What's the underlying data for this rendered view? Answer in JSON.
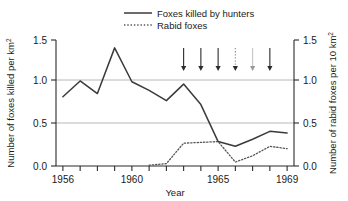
{
  "chart_data": {
    "type": "line",
    "title": "",
    "xlabel": "Year",
    "ylabel": "Number of foxes killed per km2",
    "ylabel_right": "Number of rabid foxes per 10 km2",
    "x": [
      1956,
      1957,
      1958,
      1959,
      1960,
      1961,
      1962,
      1963,
      1964,
      1965,
      1966,
      1967,
      1968,
      1969
    ],
    "xlim": [
      1955.6,
      1969.4
    ],
    "ylim": [
      0.0,
      1.6
    ],
    "ylim_right": [
      0.0,
      1.6
    ],
    "yticks": [
      "0.0",
      "0.5",
      "1.0",
      "1.5"
    ],
    "ytick_values": [
      0.0,
      0.5,
      1.0,
      1.5
    ],
    "yticks_right": [
      "0.0",
      "0.5",
      "1.0",
      "1.5"
    ],
    "xticks_labeled": [
      "1956",
      "1960",
      "1965",
      "1969"
    ],
    "xtick_values_labeled": [
      1956,
      1960,
      1965,
      1969
    ],
    "xtick_values_minor": [
      1957,
      1958,
      1959,
      1961,
      1962,
      1963,
      1964,
      1966,
      1967,
      1968
    ],
    "grid": "horizontal gridlines at 0.5 and 1.0",
    "legend_position": "top-center",
    "series": [
      {
        "name": "Foxes killed by hunters",
        "style": "solid",
        "color": "#3a3a3a",
        "axis": "left",
        "values": [
          0.88,
          1.08,
          0.92,
          1.5,
          1.07,
          0.96,
          0.83,
          1.04,
          0.78,
          0.31,
          0.25,
          0.34,
          0.44,
          0.42
        ]
      },
      {
        "name": "Rabid foxes",
        "style": "dotted",
        "color": "#555555",
        "axis": "right",
        "values": [
          null,
          null,
          null,
          null,
          null,
          0.01,
          0.03,
          0.29,
          0.3,
          0.31,
          0.05,
          0.13,
          0.25,
          0.22
        ]
      }
    ],
    "annotations": {
      "name": "downward-arrows",
      "description": "Six downward arrows above the plot indicating events",
      "arrow_years": [
        1963,
        1964,
        1965,
        1966,
        1967,
        1968
      ],
      "arrow_styles": [
        "solid",
        "solid",
        "solid",
        "dotted",
        "faint",
        "solid"
      ]
    }
  },
  "legend": {
    "items": [
      {
        "label": "Foxes killed by hunters",
        "style": "solid"
      },
      {
        "label": "Rabid foxes",
        "style": "dotted"
      }
    ]
  },
  "colors": {
    "line_solid": "#3a3a3a",
    "line_dotted": "#555555",
    "axis": "#2b2b2b",
    "grid": "#b8b8b8",
    "background": "#ffffff"
  }
}
